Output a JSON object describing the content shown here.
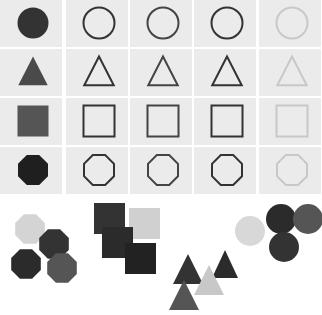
{
  "grid": {
    "columns": 5,
    "rows": 4,
    "cell_background": "#ebebeb",
    "shapes": [
      "circle",
      "triangle",
      "square",
      "octagon"
    ],
    "column_styles": [
      {
        "style": "filled",
        "color": "#333333"
      },
      {
        "style": "outline",
        "color": "#333333"
      },
      {
        "style": "outline",
        "color": "#444444"
      },
      {
        "style": "outline",
        "color": "#333333"
      },
      {
        "style": "outline",
        "color": "#c8c8c8"
      }
    ],
    "filled_colors": {
      "circle": "#333333",
      "triangle": "#4a4a4a",
      "square": "#555555",
      "octagon": "#1f1f1f"
    }
  },
  "clusters": [
    {
      "name": "octagon-cluster",
      "shape": "octagon",
      "items": [
        {
          "cx": 30,
          "cy": 229,
          "r": 16,
          "color": "#d4d4d4"
        },
        {
          "cx": 54,
          "cy": 244,
          "r": 16,
          "color": "#333333"
        },
        {
          "cx": 26,
          "cy": 264,
          "r": 16,
          "color": "#2b2b2b"
        },
        {
          "cx": 62,
          "cy": 268,
          "r": 16,
          "color": "#555555"
        }
      ]
    },
    {
      "name": "square-cluster",
      "shape": "square",
      "items": [
        {
          "x": 129,
          "y": 208,
          "s": 31,
          "color": "#d0d0d0"
        },
        {
          "x": 94,
          "y": 203,
          "s": 31,
          "color": "#333333"
        },
        {
          "x": 102,
          "y": 227,
          "s": 31,
          "color": "#2b2b2b"
        },
        {
          "x": 125,
          "y": 243,
          "s": 31,
          "color": "#222222"
        }
      ]
    },
    {
      "name": "triangle-cluster",
      "shape": "triangle",
      "items": [
        {
          "cx": 188,
          "top": 254,
          "w": 30,
          "h": 30,
          "color": "#333333"
        },
        {
          "cx": 225,
          "top": 250,
          "w": 26,
          "h": 28,
          "color": "#2b2b2b"
        },
        {
          "cx": 209,
          "top": 265,
          "w": 30,
          "h": 30,
          "color": "#c8c8c8"
        },
        {
          "cx": 184,
          "top": 280,
          "w": 30,
          "h": 30,
          "color": "#555555"
        }
      ]
    },
    {
      "name": "circle-cluster",
      "shape": "circle",
      "items": [
        {
          "cx": 250,
          "cy": 231,
          "r": 15,
          "color": "#d8d8d8"
        },
        {
          "cx": 281,
          "cy": 219,
          "r": 15,
          "color": "#2b2b2b"
        },
        {
          "cx": 308,
          "cy": 219,
          "r": 15,
          "color": "#555555"
        },
        {
          "cx": 284,
          "cy": 247,
          "r": 15,
          "color": "#333333"
        }
      ]
    }
  ]
}
